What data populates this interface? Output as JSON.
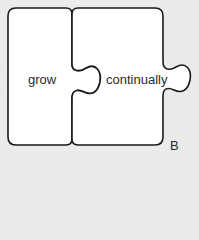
{
  "diagram": {
    "pieces": [
      {
        "id": "left",
        "word": "grow"
      },
      {
        "id": "right",
        "word": "continually"
      }
    ],
    "label": "B",
    "colors": {
      "background": "#ebebe9",
      "piece_fill": "#ffffff",
      "stroke": "#1a1a1a",
      "text": "#2a2a2a"
    }
  }
}
